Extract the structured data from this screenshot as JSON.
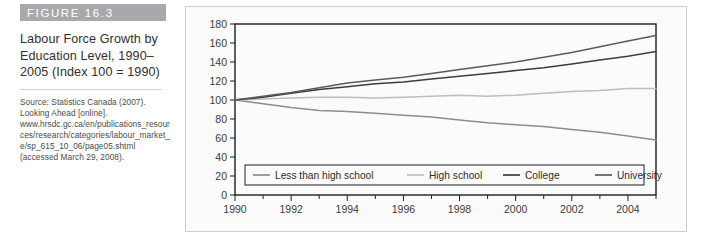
{
  "figure": {
    "header_label": "FIGURE 16.3",
    "title": "Labour Force Growth by Education Level, 1990–2005 (Index 100 = 1990)",
    "source": "Source: Statistics Canada (2007). Looking Ahead [online]. www.hrsdc.gc.ca/en/publications_resources/research/categories/labour_market_e/sp_615_10_06/page05.shtml (accessed March 29, 2008)."
  },
  "colors": {
    "header_bar": "#a8a9ac",
    "panel_background": "#fbfbfb",
    "panel_border": "#cfcfcf",
    "axis": "#1f1f1f",
    "less_than_high_school": "#8d8d8d",
    "high_school": "#bdbdbd",
    "college": "#3d3d3d",
    "university": "#5b5b5b"
  },
  "chart_data": {
    "type": "line",
    "title": "Labour Force Growth by Education Level, 1990–2005 (Index 100 = 1990)",
    "xlabel": "",
    "ylabel": "",
    "xlim": [
      1990,
      2005
    ],
    "ylim": [
      0,
      180
    ],
    "ytick_step": 20,
    "yticks": [
      0,
      20,
      40,
      60,
      80,
      100,
      120,
      140,
      160,
      180
    ],
    "xticks_major": [
      1990,
      1992,
      1994,
      1996,
      1998,
      2000,
      2002,
      2004
    ],
    "xticks_minor": [
      1991,
      1993,
      1995,
      1997,
      1999,
      2001,
      2003,
      2005
    ],
    "x": [
      1990,
      1991,
      1992,
      1993,
      1994,
      1995,
      1996,
      1997,
      1998,
      1999,
      2000,
      2001,
      2002,
      2003,
      2004,
      2005
    ],
    "grid": false,
    "legend_position": "bottom-inside",
    "series": [
      {
        "name": "Less than high school",
        "color": "#8d8d8d",
        "values": [
          100,
          96,
          92,
          89,
          88,
          86,
          84,
          82,
          79,
          76,
          74,
          72,
          69,
          66,
          62,
          58
        ]
      },
      {
        "name": "High school",
        "color": "#bdbdbd",
        "values": [
          100,
          101,
          102,
          103,
          103,
          102,
          103,
          104,
          105,
          104,
          105,
          107,
          109,
          110,
          112,
          112
        ]
      },
      {
        "name": "College",
        "color": "#3d3d3d",
        "values": [
          100,
          103,
          107,
          111,
          114,
          117,
          119,
          122,
          125,
          128,
          131,
          134,
          138,
          142,
          146,
          151
        ]
      },
      {
        "name": "University",
        "color": "#5b5b5b",
        "values": [
          100,
          104,
          108,
          113,
          118,
          121,
          124,
          128,
          132,
          136,
          140,
          145,
          150,
          156,
          162,
          168
        ]
      }
    ]
  }
}
